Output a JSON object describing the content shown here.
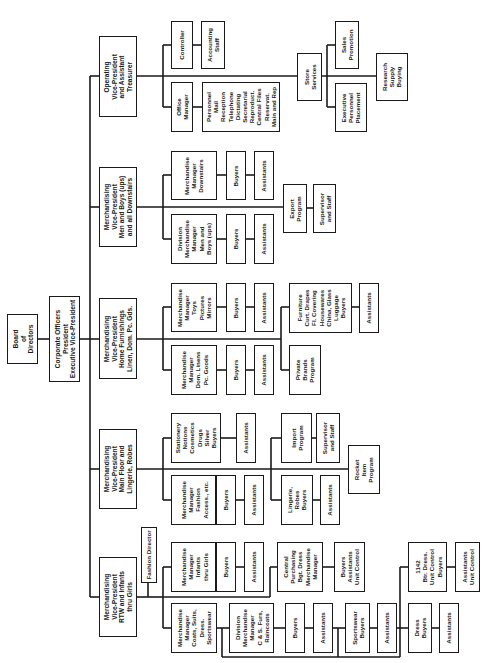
{
  "chart_data": {
    "type": "org-chart",
    "orientation": "rotated-90-clockwise",
    "root": "Board of Directors",
    "nodes": [
      {
        "id": "board",
        "label": "Board\nof\nDirectors",
        "box": [
          7,
          314,
          31,
          50
        ]
      },
      {
        "id": "corp",
        "label": "Corporate Officers\nPresident\nExecutive Vice-President",
        "box": [
          49,
          296,
          31,
          86
        ]
      },
      {
        "id": "vp_oper",
        "label": "Operating\nVice-President\nand Assistant\nTreasurer",
        "box": [
          99,
          36,
          38,
          81
        ]
      },
      {
        "id": "vp_men",
        "label": "Merchandising\nVice-President\nMen and Boys (ups)\nand all Downstairs",
        "box": [
          99,
          167,
          38,
          80
        ]
      },
      {
        "id": "vp_home",
        "label": "Merchandising\nVice-President\nHome Furnishings\nLinen, Dom. Pc. Gds.",
        "box": [
          99,
          298,
          38,
          81
        ]
      },
      {
        "id": "vp_main",
        "label": "Merchandising\nVice-President\nMain Floor and\nLingerie, Robes",
        "box": [
          99,
          429,
          38,
          80
        ]
      },
      {
        "id": "vp_rtw",
        "label": "Merchandising\nVice-President\nRTW and Infants\nthru Girls",
        "box": [
          99,
          557,
          38,
          80
        ]
      },
      {
        "id": "fashion_dir",
        "label": "Fashion Director",
        "box": [
          141,
          527,
          16,
          56
        ]
      },
      {
        "id": "controller",
        "label": "Controller",
        "box": [
          171,
          21,
          22,
          48
        ]
      },
      {
        "id": "acct_staff",
        "label": "Accounting\nStaff",
        "box": [
          201,
          21,
          24,
          48
        ]
      },
      {
        "id": "office_mgr",
        "label": "Office\nManager",
        "box": [
          171,
          82,
          22,
          50
        ]
      },
      {
        "id": "office_staff",
        "label": "Personnel\nMail\nReception\nTelephone\nDictating\nSecretarial\nReproduct.\nCentral Files\nReservat.\nMain and Rep",
        "box": [
          202,
          82,
          78,
          50
        ]
      },
      {
        "id": "store_services",
        "label": "Store\nServices",
        "box": [
          297,
          53,
          25,
          48
        ]
      },
      {
        "id": "sales_promo",
        "label": "Sales\nPromotion",
        "box": [
          335,
          21,
          24,
          48
        ]
      },
      {
        "id": "exec_personnel",
        "label": "Executive\nPersonnel\nPlacement",
        "box": [
          335,
          83,
          32,
          49
        ]
      },
      {
        "id": "research_supply",
        "label": "Research\nSupply\nBuying",
        "box": [
          376,
          53,
          32,
          48
        ]
      },
      {
        "id": "mm_downstairs",
        "label": "Merchandise\nManager\nDownstairs",
        "box": [
          171,
          151,
          46,
          49
        ]
      },
      {
        "id": "buyers_ds",
        "label": "Buyers",
        "box": [
          226,
          151,
          20,
          49
        ]
      },
      {
        "id": "asst_ds",
        "label": "Assistants",
        "box": [
          254,
          151,
          20,
          49
        ]
      },
      {
        "id": "dmm_men",
        "label": "Division\nMerchandise\nManager\nMen and\nBoys (ups)",
        "box": [
          171,
          214,
          46,
          50
        ]
      },
      {
        "id": "buyers_men",
        "label": "Buyers",
        "box": [
          226,
          214,
          20,
          50
        ]
      },
      {
        "id": "asst_men",
        "label": "Assistants",
        "box": [
          254,
          214,
          20,
          50
        ]
      },
      {
        "id": "export",
        "label": "Export\nProgram",
        "box": [
          283,
          184,
          24,
          49
        ]
      },
      {
        "id": "sup_staff_export",
        "label": "Supervisor\nand Staff",
        "box": [
          313,
          184,
          23,
          49
        ]
      },
      {
        "id": "mm_toys",
        "label": "Merchandise\nManager\nToys\nPictures\nMirrors",
        "box": [
          171,
          283,
          46,
          49
        ]
      },
      {
        "id": "buyers_toys",
        "label": "Buyers",
        "box": [
          226,
          283,
          20,
          49
        ]
      },
      {
        "id": "asst_toys",
        "label": "Assistants",
        "box": [
          254,
          283,
          20,
          49
        ]
      },
      {
        "id": "mm_linens",
        "label": "Merchandise\nManager\nDom. Linens\nPc. Goods",
        "box": [
          171,
          345,
          46,
          50
        ]
      },
      {
        "id": "buyers_linens",
        "label": "Buyers",
        "box": [
          226,
          345,
          20,
          50
        ]
      },
      {
        "id": "asst_linens",
        "label": "Assistants",
        "box": [
          254,
          345,
          20,
          50
        ]
      },
      {
        "id": "furniture_buyers",
        "label": "Furniture\nCurt. Drapes\nFl. Covering\nHousewares\nChina, Glass\nLuggage\nBuyers",
        "box": [
          289,
          283,
          63,
          50
        ]
      },
      {
        "id": "asst_furniture",
        "label": "Assistants",
        "box": [
          359,
          283,
          20,
          50
        ]
      },
      {
        "id": "private_brands",
        "label": "Private\nBrands\nProgram",
        "box": [
          289,
          345,
          32,
          50
        ]
      },
      {
        "id": "stationery_buyers",
        "label": "Stationery\nNotions\nCosmetics\nDrugs\nSilver\nBuyers",
        "box": [
          171,
          413,
          50,
          50
        ]
      },
      {
        "id": "asst_stationery",
        "label": "Assistants",
        "box": [
          236,
          413,
          20,
          50
        ]
      },
      {
        "id": "mm_fashion",
        "label": "Merchandise\nManager\nFashion\nAccess., etc.",
        "box": [
          171,
          475,
          45,
          50
        ]
      },
      {
        "id": "buyers_fashion",
        "label": "Buyers",
        "box": [
          216,
          475,
          20,
          50
        ]
      },
      {
        "id": "asst_fashion",
        "label": "Assistants",
        "box": [
          244,
          475,
          20,
          50
        ]
      },
      {
        "id": "import",
        "label": "Import\nProgram",
        "box": [
          281,
          413,
          31,
          50
        ]
      },
      {
        "id": "sup_staff_import",
        "label": "Supervisor\nand Staff",
        "box": [
          316,
          413,
          24,
          50
        ]
      },
      {
        "id": "lingerie_buyers",
        "label": "Lingerie,\nRobes\nBuyers",
        "box": [
          281,
          475,
          32,
          50
        ]
      },
      {
        "id": "asst_lingerie",
        "label": "Assistants",
        "box": [
          320,
          475,
          20,
          50
        ]
      },
      {
        "id": "rocket",
        "label": "Rocket\nItem\nProgram",
        "box": [
          348,
          445,
          32,
          49
        ]
      },
      {
        "id": "mm_infants",
        "label": "Merchandise\nManager\nInfants\nthru Girls",
        "box": [
          171,
          542,
          45,
          50
        ]
      },
      {
        "id": "buyers_infants",
        "label": "Buyers",
        "box": [
          216,
          542,
          20,
          50
        ]
      },
      {
        "id": "asst_infants",
        "label": "Assistants",
        "box": [
          244,
          542,
          20,
          50
        ]
      },
      {
        "id": "central_purch",
        "label": "Central\nPurchasing\nBgt. Dress\nMerchandise\nManager",
        "box": [
          277,
          542,
          46,
          50
        ]
      },
      {
        "id": "buyers_asst_uc",
        "label": "Buyers\nAssistants\nUnit Control",
        "box": [
          334,
          542,
          31,
          50
        ]
      },
      {
        "id": "mm_coats",
        "label": "Merchandise\nManager\nCoats, Suits,\nDress.\nSportswear",
        "box": [
          171,
          603,
          46,
          50
        ]
      },
      {
        "id": "dmm_cs",
        "label": "Division\nMerchandise\nManager\nC & S. Furs,\nRaincoats",
        "box": [
          229,
          603,
          45,
          50
        ]
      },
      {
        "id": "buyers_cs",
        "label": "Buyers",
        "box": [
          285,
          603,
          20,
          50
        ]
      },
      {
        "id": "asst_cs",
        "label": "Assistants",
        "box": [
          313,
          603,
          20,
          50
        ]
      },
      {
        "id": "sportswear_buyers",
        "label": "Sportswear\nBuyers",
        "box": [
          345,
          603,
          25,
          50
        ]
      },
      {
        "id": "asst_sportswear",
        "label": "Assistants",
        "box": [
          377,
          603,
          20,
          50
        ]
      },
      {
        "id": "btr_dress_buyers",
        "label": "1142\nBtr. Dress.\nUnit Control\nBuyers",
        "box": [
          408,
          542,
          39,
          50
        ]
      },
      {
        "id": "asst_uc",
        "label": "Assistants\nUnit Control",
        "box": [
          455,
          542,
          25,
          50
        ]
      },
      {
        "id": "dress_buyers",
        "label": "Dress\nBuyers",
        "box": [
          408,
          603,
          24,
          50
        ]
      },
      {
        "id": "asst_dress",
        "label": "Assistants",
        "box": [
          439,
          603,
          20,
          50
        ]
      }
    ],
    "edges": [
      [
        "board",
        "corp"
      ],
      [
        "corp",
        "vp_oper"
      ],
      [
        "corp",
        "vp_men"
      ],
      [
        "corp",
        "vp_home"
      ],
      [
        "corp",
        "vp_main"
      ],
      [
        "corp",
        "vp_rtw"
      ],
      [
        "vp_rtw",
        "fashion_dir"
      ],
      [
        "vp_oper",
        "controller"
      ],
      [
        "controller",
        "acct_staff"
      ],
      [
        "vp_oper",
        "office_mgr"
      ],
      [
        "office_mgr",
        "office_staff"
      ],
      [
        "vp_oper",
        "store_services"
      ],
      [
        "store_services",
        "sales_promo"
      ],
      [
        "store_services",
        "exec_personnel"
      ],
      [
        "store_services",
        "research_supply"
      ],
      [
        "vp_men",
        "mm_downstairs"
      ],
      [
        "mm_downstairs",
        "buyers_ds"
      ],
      [
        "buyers_ds",
        "asst_ds"
      ],
      [
        "vp_men",
        "dmm_men"
      ],
      [
        "dmm_men",
        "buyers_men"
      ],
      [
        "buyers_men",
        "asst_men"
      ],
      [
        "vp_men",
        "export"
      ],
      [
        "export",
        "sup_staff_export"
      ],
      [
        "vp_home",
        "mm_toys"
      ],
      [
        "mm_toys",
        "buyers_toys"
      ],
      [
        "buyers_toys",
        "asst_toys"
      ],
      [
        "vp_home",
        "mm_linens"
      ],
      [
        "mm_linens",
        "buyers_linens"
      ],
      [
        "buyers_linens",
        "asst_linens"
      ],
      [
        "vp_home",
        "furniture_buyers"
      ],
      [
        "furniture_buyers",
        "asst_furniture"
      ],
      [
        "vp_home",
        "private_brands"
      ],
      [
        "vp_main",
        "stationery_buyers"
      ],
      [
        "stationery_buyers",
        "asst_stationery"
      ],
      [
        "vp_main",
        "mm_fashion"
      ],
      [
        "mm_fashion",
        "buyers_fashion"
      ],
      [
        "buyers_fashion",
        "asst_fashion"
      ],
      [
        "vp_main",
        "import"
      ],
      [
        "import",
        "sup_staff_import"
      ],
      [
        "vp_main",
        "lingerie_buyers"
      ],
      [
        "lingerie_buyers",
        "asst_lingerie"
      ],
      [
        "vp_main",
        "rocket"
      ],
      [
        "vp_rtw",
        "mm_infants"
      ],
      [
        "mm_infants",
        "buyers_infants"
      ],
      [
        "buyers_infants",
        "asst_infants"
      ],
      [
        "vp_rtw",
        "central_purch"
      ],
      [
        "central_purch",
        "buyers_asst_uc"
      ],
      [
        "vp_rtw",
        "mm_coats"
      ],
      [
        "mm_coats",
        "dmm_cs"
      ],
      [
        "dmm_cs",
        "buyers_cs"
      ],
      [
        "buyers_cs",
        "asst_cs"
      ],
      [
        "mm_coats",
        "sportswear_buyers"
      ],
      [
        "sportswear_buyers",
        "asst_sportswear"
      ],
      [
        "mm_coats",
        "btr_dress_buyers"
      ],
      [
        "btr_dress_buyers",
        "asst_uc"
      ],
      [
        "mm_coats",
        "dress_buyers"
      ],
      [
        "dress_buyers",
        "asst_dress"
      ]
    ],
    "colors": {
      "line": "#1a1a1a",
      "box_border": "#1a1a1a",
      "background": "#ffffff",
      "text": "#1a1a1a"
    }
  }
}
